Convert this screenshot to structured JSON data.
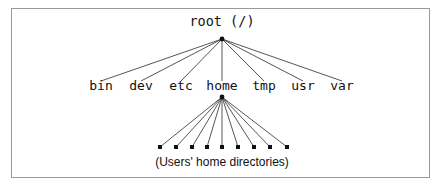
{
  "figure": {
    "type": "tree-diagram",
    "background_color": "#ffffff",
    "frame_color": "#9a9a9a",
    "line_color": "#2b2b2b",
    "text_color": "#111111"
  },
  "tree": {
    "root": {
      "label": "root (/)",
      "x": 222,
      "y": 26,
      "vertex_x": 222,
      "vertex_y": 39
    },
    "level1": {
      "y": 90,
      "nodes": [
        {
          "label": "bin",
          "x": 101
        },
        {
          "label": "dev",
          "x": 141
        },
        {
          "label": "etc",
          "x": 181
        },
        {
          "label": "home",
          "x": 222
        },
        {
          "label": "tmp",
          "x": 264
        },
        {
          "label": "usr",
          "x": 303
        },
        {
          "label": "var",
          "x": 342
        }
      ]
    },
    "home_children": {
      "parent_label": "home",
      "vertex_x": 222,
      "vertex_y": 97,
      "leaf_y": 147,
      "leaf_size": 4,
      "count": 9,
      "leaf_x": [
        160,
        176,
        192,
        207,
        222,
        238,
        254,
        270,
        287
      ],
      "caption": "(Users' home directories)",
      "caption_x": 222,
      "caption_y": 166
    }
  }
}
